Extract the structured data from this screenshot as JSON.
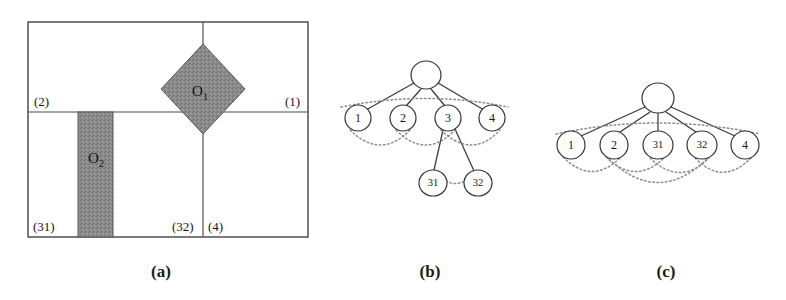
{
  "figure": {
    "background_color": "#ffffff",
    "line_color": "#3c3c3c",
    "shade_color": "#8a8a8a",
    "arc_color": "#8d8d8d",
    "panels": [
      {
        "id": "a",
        "caption": "(a)",
        "caption_x": 161,
        "caption_y": 277
      },
      {
        "id": "b",
        "caption": "(b)",
        "caption_x": 430,
        "caption_y": 277
      },
      {
        "id": "c",
        "caption": "(c)",
        "caption_x": 666,
        "caption_y": 277
      }
    ]
  },
  "panel_a": {
    "frame": {
      "x": 28,
      "y": 22,
      "width": 280,
      "height": 215
    },
    "partition_lines": [
      {
        "name": "horizontal-split",
        "x1": 28,
        "y1": 112,
        "x2": 308,
        "y2": 112
      },
      {
        "name": "vertical-split-right",
        "x1": 203,
        "y1": 22,
        "x2": 203,
        "y2": 237
      }
    ],
    "region_labels": [
      {
        "text": "(2)",
        "x": 34,
        "y": 106
      },
      {
        "text": "(1)",
        "x": 285,
        "y": 106
      },
      {
        "text": "(31)",
        "x": 33,
        "y": 231
      },
      {
        "text": "(32)",
        "x": 172,
        "y": 231
      },
      {
        "text": "(4)",
        "x": 208,
        "y": 231
      }
    ],
    "objects": [
      {
        "name": "object-o1",
        "shape": "diamond",
        "label": "O",
        "subscript": "1",
        "center_x": 203,
        "center_y": 89,
        "half_width": 42,
        "half_height": 45,
        "fill": "#8a8a8a"
      },
      {
        "name": "object-o2",
        "shape": "rectangle",
        "label": "O",
        "subscript": "2",
        "x": 78,
        "y": 112,
        "width": 35,
        "height": 125,
        "fill": "#8a8a8a"
      }
    ]
  },
  "panel_b": {
    "root": {
      "name": "root",
      "label": "",
      "cx": 426,
      "cy": 75,
      "rx": 15,
      "ry": 14
    },
    "nodes": [
      {
        "name": "node-1",
        "label": "1",
        "cx": 358,
        "cy": 118,
        "rx": 13,
        "ry": 13,
        "small": false
      },
      {
        "name": "node-2",
        "label": "2",
        "cx": 403,
        "cy": 118,
        "rx": 13,
        "ry": 13,
        "small": false
      },
      {
        "name": "node-3",
        "label": "3",
        "cx": 448,
        "cy": 118,
        "rx": 13,
        "ry": 13,
        "small": false
      },
      {
        "name": "node-4",
        "label": "4",
        "cx": 492,
        "cy": 118,
        "rx": 13,
        "ry": 13,
        "small": false
      },
      {
        "name": "node-31",
        "label": "31",
        "cx": 433,
        "cy": 183,
        "rx": 14,
        "ry": 13,
        "small": true
      },
      {
        "name": "node-32",
        "label": "32",
        "cx": 478,
        "cy": 183,
        "rx": 14,
        "ry": 13,
        "small": true
      }
    ],
    "edges": [
      {
        "from": "root",
        "to": "node-1"
      },
      {
        "from": "root",
        "to": "node-2"
      },
      {
        "from": "root",
        "to": "node-3"
      },
      {
        "from": "root",
        "to": "node-4"
      },
      {
        "from": "node-3",
        "to": "node-31"
      },
      {
        "from": "node-3",
        "to": "node-32"
      }
    ],
    "arcs": [
      {
        "name": "arc-1-2",
        "from": "node-1",
        "to": "node-2",
        "sag": 22
      },
      {
        "name": "arc-2-3",
        "from": "node-2",
        "to": "node-3",
        "sag": 22
      },
      {
        "name": "arc-3-4",
        "from": "node-3",
        "to": "node-4",
        "sag": 22
      },
      {
        "name": "arc-31-32",
        "from": "node-31",
        "to": "node-32",
        "sag": 0
      }
    ],
    "top_arc": {
      "name": "arc-root-span",
      "x1": 341,
      "y1": 104,
      "x2": 508,
      "y2": 104,
      "sag": -14
    }
  },
  "panel_c": {
    "root": {
      "name": "root",
      "label": "",
      "cx": 658,
      "cy": 98,
      "rx": 16,
      "ry": 15
    },
    "nodes": [
      {
        "name": "node-1",
        "label": "1",
        "cx": 571,
        "cy": 145,
        "rx": 14,
        "ry": 14,
        "small": false
      },
      {
        "name": "node-2",
        "label": "2",
        "cx": 614,
        "cy": 145,
        "rx": 14,
        "ry": 14,
        "small": false
      },
      {
        "name": "node-31",
        "label": "31",
        "cx": 658,
        "cy": 145,
        "rx": 15,
        "ry": 14,
        "small": true
      },
      {
        "name": "node-32",
        "label": "32",
        "cx": 702,
        "cy": 145,
        "rx": 15,
        "ry": 14,
        "small": true
      },
      {
        "name": "node-4",
        "label": "4",
        "cx": 745,
        "cy": 145,
        "rx": 14,
        "ry": 14,
        "small": false
      }
    ],
    "edges": [
      {
        "from": "root",
        "to": "node-1"
      },
      {
        "from": "root",
        "to": "node-2"
      },
      {
        "from": "root",
        "to": "node-31"
      },
      {
        "from": "root",
        "to": "node-32"
      },
      {
        "from": "root",
        "to": "node-4"
      }
    ],
    "arcs": [
      {
        "name": "arc-1-2",
        "from": "node-1",
        "to": "node-2",
        "sag": 20
      },
      {
        "name": "arc-2-31",
        "from": "node-2",
        "to": "node-31",
        "sag": 20
      },
      {
        "name": "arc-31-32",
        "from": "node-31",
        "to": "node-32",
        "sag": 20
      },
      {
        "name": "arc-32-4",
        "from": "node-32",
        "to": "node-4",
        "sag": 20
      },
      {
        "name": "arc-2-32",
        "from": "node-2",
        "to": "node-32",
        "sag": 38
      }
    ],
    "top_arc": {
      "name": "arc-root-span",
      "x1": 556,
      "y1": 131,
      "x2": 760,
      "y2": 131,
      "sag": -16
    }
  }
}
